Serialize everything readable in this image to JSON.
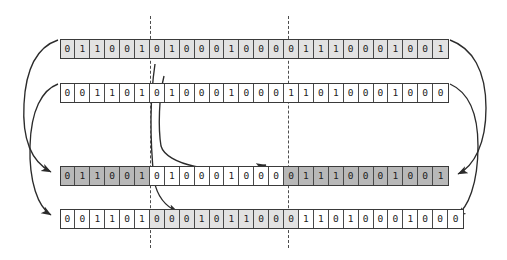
{
  "figure": {
    "type": "two-point-crossover-diagram",
    "bit_symbols": {
      "zero": "0",
      "one": "1"
    },
    "colors": {
      "background": "#ffffff",
      "cell_border": "#4a4a4a",
      "row_border": "#3a3a3a",
      "fill_white": "#ffffff",
      "fill_light": "#e2e2e2",
      "fill_dark": "#b8b8b8",
      "arrow": "#2b2b2b",
      "dashed_line": "#4d4d4d",
      "text": "#1c1c1c"
    },
    "crossover_points": [
      {
        "name": "crossover-point-1",
        "after_bit_index": 6,
        "x": 150
      },
      {
        "name": "crossover-point-2",
        "after_bit_index": 15,
        "x": 288
      }
    ],
    "rows": [
      {
        "name": "parent-1",
        "role": "parent",
        "y": 39,
        "segments": [
          {
            "shade": "light",
            "bits": [
              "0",
              "1",
              "1",
              "0",
              "0",
              "1"
            ]
          },
          {
            "shade": "light",
            "bits": [
              "0",
              "1",
              "0",
              "0",
              "0",
              "1",
              "0",
              "0",
              "0"
            ]
          },
          {
            "shade": "light",
            "bits": [
              "0",
              "1",
              "1",
              "1",
              "0",
              "0",
              "0",
              "1",
              "0",
              "0",
              "1"
            ]
          }
        ]
      },
      {
        "name": "parent-2",
        "role": "parent",
        "y": 83,
        "segments": [
          {
            "shade": "white",
            "bits": [
              "0",
              "0",
              "1",
              "1",
              "0",
              "1"
            ]
          },
          {
            "shade": "white",
            "bits": [
              "0",
              "1",
              "0",
              "0",
              "0",
              "1",
              "0",
              "0",
              "0"
            ]
          },
          {
            "shade": "white",
            "bits": [
              "1",
              "1",
              "0",
              "1",
              "0",
              "0",
              "0",
              "1",
              "0",
              "0",
              "0"
            ]
          }
        ]
      },
      {
        "name": "offspring-1",
        "role": "offspring",
        "y": 166,
        "segments": [
          {
            "shade": "dark",
            "bits": [
              "0",
              "1",
              "1",
              "0",
              "0",
              "1"
            ]
          },
          {
            "shade": "white",
            "bits": [
              "0",
              "1",
              "0",
              "0",
              "0",
              "1",
              "0",
              "0",
              "0"
            ]
          },
          {
            "shade": "dark",
            "bits": [
              "0",
              "1",
              "1",
              "1",
              "0",
              "0",
              "0",
              "1",
              "0",
              "0",
              "1"
            ]
          }
        ]
      },
      {
        "name": "offspring-2",
        "role": "offspring",
        "y": 209,
        "segments": [
          {
            "shade": "white",
            "bits": [
              "0",
              "0",
              "1",
              "1",
              "0",
              "1"
            ]
          },
          {
            "shade": "light",
            "bits": [
              "0",
              "0",
              "0",
              "1",
              "0",
              "1",
              "1",
              "0",
              "0",
              "0"
            ]
          },
          {
            "shade": "white",
            "bits": [
              "1",
              "1",
              "0",
              "1",
              "0",
              "0",
              "0",
              "1",
              "0",
              "0",
              "0"
            ]
          }
        ]
      }
    ],
    "arrows": [
      {
        "name": "arrow-parent1-left-to-offspring1",
        "from": "parent-1-left-end",
        "to": "offspring-1-left-end"
      },
      {
        "name": "arrow-parent2-left-to-offspring2",
        "from": "parent-2-left-end",
        "to": "offspring-2-left-end"
      },
      {
        "name": "arrow-parent1-right-to-offspring1",
        "from": "parent-1-right-end",
        "to": "offspring-1-right-end"
      },
      {
        "name": "arrow-parent2-right-to-offspring2",
        "from": "parent-2-right-end",
        "to": "offspring-2-right-end"
      },
      {
        "name": "arrow-parent2-middle-to-offspring1",
        "from": "parent-2-middle",
        "to": "offspring-1-middle"
      },
      {
        "name": "arrow-parent1-middle-to-offspring2",
        "from": "parent-1-middle",
        "to": "offspring-2-middle"
      }
    ]
  }
}
